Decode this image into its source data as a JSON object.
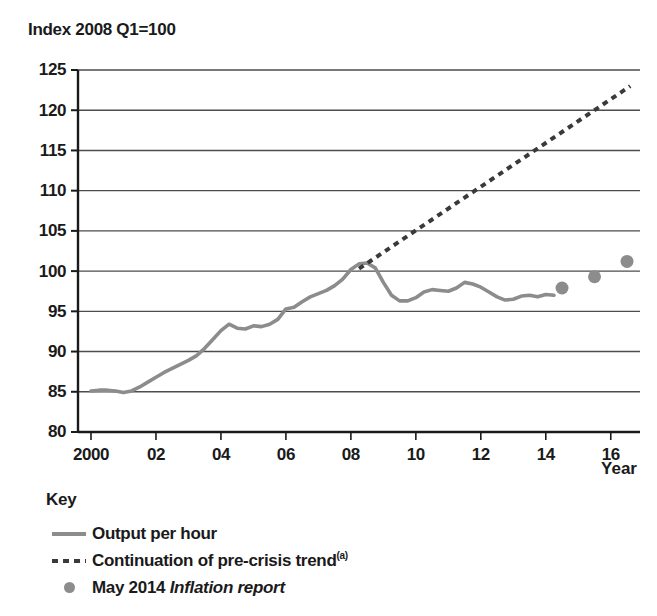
{
  "chart_data": {
    "type": "line",
    "title": "Index 2008 Q1=100",
    "xlabel": "Year",
    "ylabel": "",
    "xlim": [
      1999.6,
      2016.9
    ],
    "ylim": [
      80,
      125
    ],
    "grid": true,
    "legend_position": "below-left",
    "y_ticks": [
      "125",
      "120",
      "115",
      "110",
      "105",
      "100",
      "95",
      "90",
      "85",
      "80"
    ],
    "y_tick_values": [
      125,
      120,
      115,
      110,
      105,
      100,
      95,
      90,
      85,
      80
    ],
    "x_ticks": [
      "2000",
      "02",
      "04",
      "06",
      "08",
      "10",
      "12",
      "14",
      "16"
    ],
    "x_tick_values": [
      2000,
      2002,
      2004,
      2006,
      2008,
      2010,
      2012,
      2014,
      2016
    ],
    "series": [
      {
        "name": "Output per hour",
        "style": "solid",
        "color": "#8c8c8c",
        "x": [
          2000.0,
          2000.25,
          2000.5,
          2000.75,
          2001.0,
          2001.25,
          2001.5,
          2001.75,
          2002.0,
          2002.25,
          2002.5,
          2002.75,
          2003.0,
          2003.25,
          2003.5,
          2003.75,
          2004.0,
          2004.25,
          2004.5,
          2004.75,
          2005.0,
          2005.25,
          2005.5,
          2005.75,
          2006.0,
          2006.25,
          2006.5,
          2006.75,
          2007.0,
          2007.25,
          2007.5,
          2007.75,
          2008.0,
          2008.25,
          2008.5,
          2008.75,
          2009.0,
          2009.25,
          2009.5,
          2009.75,
          2010.0,
          2010.25,
          2010.5,
          2010.75,
          2011.0,
          2011.25,
          2011.5,
          2011.75,
          2012.0,
          2012.25,
          2012.5,
          2012.75,
          2013.0,
          2013.25,
          2013.5,
          2013.75,
          2014.0,
          2014.25
        ],
        "values": [
          85.1,
          85.2,
          85.2,
          85.1,
          84.9,
          85.1,
          85.6,
          86.2,
          86.8,
          87.4,
          87.9,
          88.4,
          88.9,
          89.5,
          90.4,
          91.5,
          92.6,
          93.4,
          92.9,
          92.8,
          93.2,
          93.1,
          93.4,
          94.0,
          95.3,
          95.5,
          96.2,
          96.8,
          97.2,
          97.6,
          98.2,
          99.0,
          100.2,
          100.9,
          101.0,
          100.4,
          98.6,
          97.0,
          96.3,
          96.3,
          96.7,
          97.4,
          97.7,
          97.6,
          97.5,
          97.9,
          98.6,
          98.4,
          98.0,
          97.4,
          96.8,
          96.4,
          96.5,
          96.9,
          97.0,
          96.8,
          97.1,
          97.0
        ]
      },
      {
        "name": "Continuation of pre-crisis trend",
        "style": "dashed",
        "color": "#3a3a3a",
        "x": [
          2008.25,
          2016.6
        ],
        "values": [
          100.3,
          123.0
        ]
      },
      {
        "name": "May 2014 Inflation report",
        "style": "dots",
        "color": "#8c8c8c",
        "x": [
          2014.5,
          2015.5,
          2016.5
        ],
        "values": [
          97.9,
          99.3,
          101.2
        ]
      }
    ]
  },
  "title": "Index 2008 Q1=100",
  "axes": {
    "x_axis_name": "Year",
    "y_ticks": [
      "125",
      "120",
      "115",
      "110",
      "105",
      "100",
      "95",
      "90",
      "85",
      "80"
    ],
    "x_ticks": [
      "2000",
      "02",
      "04",
      "06",
      "08",
      "10",
      "12",
      "14",
      "16"
    ]
  },
  "legend": {
    "title": "Key",
    "items": [
      {
        "label": "Output per hour",
        "marker": "solid-line-swatch"
      },
      {
        "label": "Continuation of pre-crisis trend",
        "footnote": "(a)",
        "marker": "dashed-line-swatch"
      },
      {
        "label_plain": "May 2014 ",
        "label_italic": "Inflation report",
        "marker": "dot-swatch"
      }
    ]
  },
  "colors": {
    "series_line": "#8c8c8c",
    "trend_line": "#3a3a3a",
    "dots": "#8c8c8c",
    "axis": "#1a1a1a",
    "grid": "#4d4d4d",
    "text": "#1a1a1a"
  }
}
